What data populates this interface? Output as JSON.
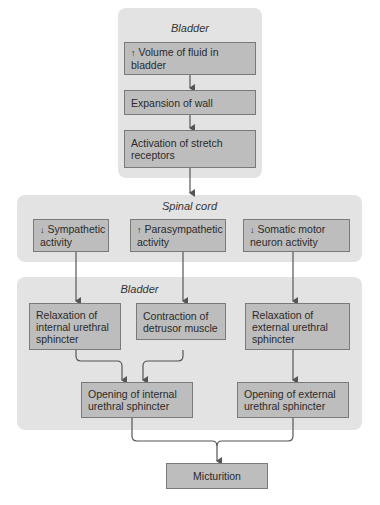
{
  "colors": {
    "panel": "#e3e3e3",
    "box": "#bdbdbd",
    "box_border": "#7a7a7a",
    "line": "#555555"
  },
  "panels": {
    "bladder_top": {
      "title": "Bladder"
    },
    "spinal_cord": {
      "title": "Spinal cord"
    },
    "bladder_bottom": {
      "title": "Bladder"
    }
  },
  "nodes": {
    "volume": {
      "indicator": "↑",
      "indicator_meaning": "increase",
      "text": "Volume of fluid in bladder"
    },
    "expansion": {
      "text": "Expansion of wall"
    },
    "activation": {
      "text": "Activation of stretch receptors"
    },
    "sympathetic": {
      "indicator": "↓",
      "indicator_meaning": "decrease",
      "text": "Sympathetic activity"
    },
    "parasympathetic": {
      "indicator": "↑",
      "indicator_meaning": "increase",
      "text": "Parasympathetic activity"
    },
    "somatic": {
      "indicator": "↓",
      "indicator_meaning": "decrease",
      "text": "Somatic motor neuron activity"
    },
    "relax_internal": {
      "text": "Relaxation of internal urethral sphincter"
    },
    "contract_detrusor": {
      "text": "Contraction of detrusor muscle"
    },
    "relax_external": {
      "text": "Relaxation of external urethral sphincter"
    },
    "open_internal": {
      "text": "Opening of internal urethral sphincter"
    },
    "open_external": {
      "text": "Opening of external urethral sphincter"
    },
    "micturition": {
      "text": "Micturition"
    }
  },
  "edges": [
    [
      "volume",
      "expansion"
    ],
    [
      "expansion",
      "activation"
    ],
    [
      "activation",
      "spinal_cord"
    ],
    [
      "sympathetic",
      "relax_internal"
    ],
    [
      "parasympathetic",
      "contract_detrusor"
    ],
    [
      "somatic",
      "relax_external"
    ],
    [
      "relax_internal",
      "open_internal"
    ],
    [
      "contract_detrusor",
      "open_internal"
    ],
    [
      "relax_external",
      "open_external"
    ],
    [
      "open_internal",
      "micturition"
    ],
    [
      "open_external",
      "micturition"
    ]
  ]
}
